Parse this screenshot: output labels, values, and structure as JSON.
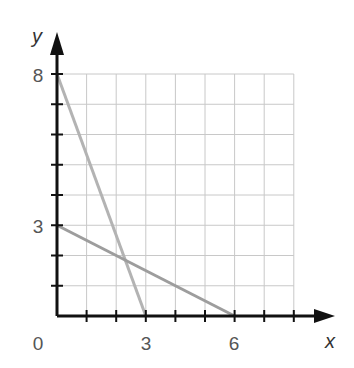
{
  "chart_data": {
    "type": "line",
    "title": "",
    "xlabel": "x",
    "ylabel": "y",
    "xlim": [
      0,
      8
    ],
    "ylim": [
      0,
      8
    ],
    "grid": true,
    "x_tick_labels": [
      "0",
      "3",
      "6"
    ],
    "y_tick_labels": [
      "8",
      "3"
    ],
    "x_ticks": [
      1,
      2,
      3,
      4,
      5,
      6,
      7,
      8
    ],
    "y_ticks": [
      1,
      2,
      3,
      4,
      5,
      6,
      7,
      8
    ],
    "series": [
      {
        "name": "line-1",
        "points": [
          [
            0,
            8
          ],
          [
            3,
            0
          ]
        ],
        "color": "#b3b3b3"
      },
      {
        "name": "line-2",
        "points": [
          [
            0,
            3
          ],
          [
            6,
            0
          ]
        ],
        "color": "#9d9d9d"
      }
    ],
    "legend": null
  },
  "labels": {
    "origin": "0",
    "x3": "3",
    "x6": "6",
    "y8": "8",
    "y3": "3",
    "x_axis": "x",
    "y_axis": "y"
  }
}
